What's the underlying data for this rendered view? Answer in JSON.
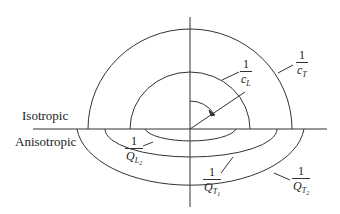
{
  "diagram": {
    "type": "wave-slowness-surface",
    "labels": {
      "isotropic": "Isotropic",
      "anisotropic": "Anisotropic"
    },
    "fractions": {
      "cL": {
        "numerator": "1",
        "denominator": "c",
        "subscript": "L"
      },
      "cT": {
        "numerator": "1",
        "denominator": "c",
        "subscript": "T"
      },
      "QL2": {
        "numerator": "1",
        "denominator": "Q",
        "subscript": "L",
        "subsubscript": "2"
      },
      "QT1": {
        "numerator": "1",
        "denominator": "Q",
        "subscript": "T",
        "subsubscript": "1"
      },
      "QT2": {
        "numerator": "1",
        "denominator": "Q",
        "subscript": "T",
        "subsubscript": "2"
      }
    },
    "colors": {
      "line": "#333333",
      "text": "#222222",
      "background": "#ffffff"
    }
  }
}
